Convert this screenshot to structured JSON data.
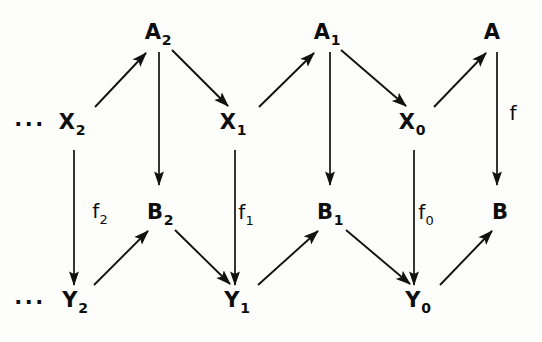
{
  "diagram": {
    "background_color": "#fdfdfc",
    "ink_color": "#111111",
    "nodes": [
      {
        "id": "A2",
        "base": "A",
        "sub": "2",
        "x": 158,
        "y": 32
      },
      {
        "id": "A1",
        "base": "A",
        "sub": "1",
        "x": 327,
        "y": 32
      },
      {
        "id": "A",
        "base": "A",
        "sub": "",
        "x": 492,
        "y": 32
      },
      {
        "id": "X2",
        "base": "X",
        "sub": "2",
        "x": 72,
        "y": 122
      },
      {
        "id": "X1",
        "base": "X",
        "sub": "1",
        "x": 233,
        "y": 122
      },
      {
        "id": "X0",
        "base": "X",
        "sub": "0",
        "x": 412,
        "y": 122
      },
      {
        "id": "B2",
        "base": "B",
        "sub": "2",
        "x": 160,
        "y": 212
      },
      {
        "id": "B1",
        "base": "B",
        "sub": "1",
        "x": 330,
        "y": 212
      },
      {
        "id": "B",
        "base": "B",
        "sub": "",
        "x": 500,
        "y": 212
      },
      {
        "id": "Y2",
        "base": "Y",
        "sub": "2",
        "x": 75,
        "y": 300
      },
      {
        "id": "Y1",
        "base": "Y",
        "sub": "1",
        "x": 237,
        "y": 300
      },
      {
        "id": "Y0",
        "base": "Y",
        "sub": "0",
        "x": 418,
        "y": 300
      }
    ],
    "morphism_labels": [
      {
        "id": "f2",
        "base": "f",
        "sub": "2",
        "x": 100,
        "y": 211
      },
      {
        "id": "f1",
        "base": "f",
        "sub": "1",
        "x": 246,
        "y": 212
      },
      {
        "id": "f0",
        "base": "f",
        "sub": "0",
        "x": 426,
        "y": 212
      },
      {
        "id": "f",
        "base": "f",
        "sub": "",
        "x": 513,
        "y": 113
      }
    ],
    "ellipses": [
      {
        "id": "ellipsis-x-row",
        "text": "···",
        "x": 30,
        "y": 124
      },
      {
        "id": "ellipsis-y-row",
        "text": "···",
        "x": 30,
        "y": 302
      }
    ],
    "arrows": [
      {
        "id": "arrow-X2-to-A2",
        "from": "X2",
        "to": "A2",
        "kind": "diagonal-up-right",
        "x1": 95,
        "y1": 107,
        "x2": 146,
        "y2": 53
      },
      {
        "id": "arrow-A2-to-X1",
        "from": "A2",
        "to": "X1",
        "kind": "diagonal-down-right",
        "x1": 172,
        "y1": 50,
        "x2": 228,
        "y2": 106
      },
      {
        "id": "arrow-X1-to-A1",
        "from": "X1",
        "to": "A1",
        "kind": "diagonal-up-right",
        "x1": 259,
        "y1": 107,
        "x2": 314,
        "y2": 53
      },
      {
        "id": "arrow-A1-to-X0",
        "from": "A1",
        "to": "X0",
        "kind": "diagonal-down-right",
        "x1": 341,
        "y1": 50,
        "x2": 406,
        "y2": 106
      },
      {
        "id": "arrow-X0-to-A",
        "from": "X0",
        "to": "A",
        "kind": "diagonal-up-right",
        "x1": 434,
        "y1": 107,
        "x2": 486,
        "y2": 53
      },
      {
        "id": "arrow-A2-to-B2",
        "from": "A2",
        "to": "B2",
        "kind": "vertical-down",
        "x1": 159,
        "y1": 52,
        "x2": 159,
        "y2": 185
      },
      {
        "id": "arrow-A1-to-B1",
        "from": "A1",
        "to": "B1",
        "kind": "vertical-down",
        "x1": 330,
        "y1": 52,
        "x2": 330,
        "y2": 185
      },
      {
        "id": "arrow-A-to-B",
        "from": "A",
        "to": "B",
        "kind": "vertical-down",
        "x1": 497,
        "y1": 52,
        "x2": 497,
        "y2": 185
      },
      {
        "id": "arrow-X2-to-Y2",
        "from": "X2",
        "to": "Y2",
        "kind": "vertical-down",
        "x1": 74,
        "y1": 150,
        "x2": 74,
        "y2": 285
      },
      {
        "id": "arrow-X1-to-Y1",
        "from": "X1",
        "to": "Y1",
        "kind": "vertical-down",
        "x1": 235,
        "y1": 150,
        "x2": 235,
        "y2": 285
      },
      {
        "id": "arrow-X0-to-Y0",
        "from": "X0",
        "to": "Y0",
        "kind": "vertical-down",
        "x1": 414,
        "y1": 150,
        "x2": 414,
        "y2": 285
      },
      {
        "id": "arrow-Y2-to-B2",
        "from": "Y2",
        "to": "B2",
        "kind": "diagonal-up-right",
        "x1": 94,
        "y1": 285,
        "x2": 148,
        "y2": 231
      },
      {
        "id": "arrow-B2-to-Y1",
        "from": "B2",
        "to": "Y1",
        "kind": "diagonal-down-right",
        "x1": 175,
        "y1": 230,
        "x2": 230,
        "y2": 284
      },
      {
        "id": "arrow-Y1-to-B1",
        "from": "Y1",
        "to": "B1",
        "kind": "diagonal-up-right",
        "x1": 258,
        "y1": 285,
        "x2": 318,
        "y2": 231
      },
      {
        "id": "arrow-B1-to-Y0",
        "from": "B1",
        "to": "Y0",
        "kind": "diagonal-down-right",
        "x1": 346,
        "y1": 230,
        "x2": 410,
        "y2": 284
      },
      {
        "id": "arrow-Y0-to-B",
        "from": "Y0",
        "to": "B",
        "kind": "diagonal-up-right",
        "x1": 440,
        "y1": 285,
        "x2": 492,
        "y2": 231
      }
    ]
  }
}
